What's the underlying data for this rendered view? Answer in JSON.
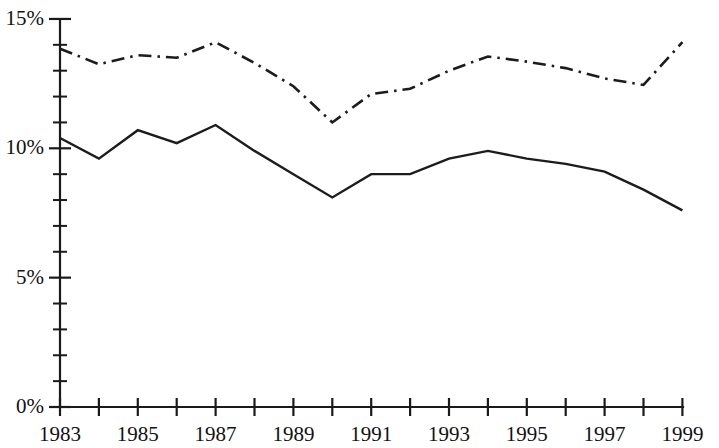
{
  "chart_data": {
    "type": "line",
    "title": "",
    "subtitle": "",
    "xlabel": "",
    "ylabel": "",
    "xlim": [
      1983,
      1999
    ],
    "ylim": [
      0,
      15
    ],
    "grid": false,
    "legend": "none",
    "y_tick_labels": [
      "15%",
      "10%",
      "5%",
      "0%"
    ],
    "y_tick_values": [
      15,
      10,
      5,
      0
    ],
    "y_minor_step": 1,
    "x_tick_labels": [
      "1983",
      "1985",
      "1987",
      "1989",
      "1991",
      "1993",
      "1995",
      "1997",
      "1999"
    ],
    "x_tick_values": [
      1983,
      1985,
      1987,
      1989,
      1991,
      1993,
      1995,
      1997,
      1999
    ],
    "x_minor_step": 1,
    "x": [
      1983,
      1984,
      1985,
      1986,
      1987,
      1988,
      1989,
      1990,
      1991,
      1992,
      1993,
      1994,
      1995,
      1996,
      1997,
      1998,
      1999
    ],
    "series": [
      {
        "name": "solid-series",
        "style": "solid",
        "color": "#1c1c1c",
        "values": [
          10.4,
          9.6,
          10.7,
          10.2,
          10.9,
          9.9,
          9.0,
          8.1,
          9.0,
          9.0,
          9.6,
          9.9,
          9.6,
          9.4,
          9.1,
          8.4,
          7.6
        ]
      },
      {
        "name": "dash-dot-series",
        "style": "dash-dot",
        "color": "#1c1c1c",
        "values": [
          13.85,
          13.25,
          13.6,
          13.5,
          14.1,
          13.3,
          12.4,
          11.0,
          12.1,
          12.3,
          13.0,
          13.55,
          13.35,
          13.1,
          12.7,
          12.45,
          14.1
        ]
      }
    ]
  },
  "axes_geometry": {
    "origin_x": 60,
    "origin_y": 407,
    "right_x": 683,
    "top_y": 19,
    "px_per_year": 38.9,
    "px_per_percent": 25.87
  }
}
